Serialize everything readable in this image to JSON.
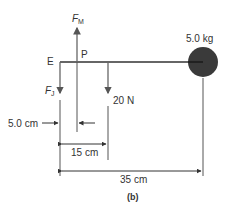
{
  "diagram": {
    "caption": "(b)",
    "mass_label": "5.0 kg",
    "point_E": "E",
    "point_P": "P",
    "force_muscle": {
      "symbol": "F",
      "subscript": "M"
    },
    "force_joint": {
      "symbol": "F",
      "subscript": "J"
    },
    "force_weight": "20 N",
    "dim_5cm": "5.0 cm",
    "dim_15cm": "15 cm",
    "dim_35cm": "35 cm",
    "colors": {
      "line": "#444444",
      "mass": "#333333",
      "arrow": "#666666"
    }
  }
}
